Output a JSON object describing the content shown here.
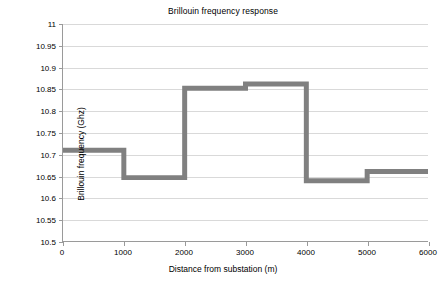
{
  "chart_data": {
    "type": "line",
    "title": "Brillouin frequency response",
    "xlabel": "Distance from substation (m)",
    "ylabel": "Brillouin frequency (Ghz)",
    "xlim": [
      0,
      6000
    ],
    "ylim": [
      10.5,
      11
    ],
    "grid": true,
    "legend": "none",
    "line_color": "#808080",
    "line_width": 5,
    "style": "step",
    "xticks": [
      0,
      1000,
      2000,
      3000,
      4000,
      5000,
      6000
    ],
    "xtick_labels": [
      "0",
      "1000",
      "2000",
      "3000",
      "4000",
      "5000",
      "6000"
    ],
    "yticks": [
      10.5,
      10.55,
      10.6,
      10.65,
      10.7,
      10.75,
      10.8,
      10.85,
      10.9,
      10.95,
      11
    ],
    "ytick_labels": [
      "10.5",
      "10.55",
      "10.6",
      "10.65",
      "10.7",
      "10.75",
      "10.8",
      "10.85",
      "10.9",
      "10.95",
      "11"
    ],
    "series": [
      {
        "name": "Brillouin frequency",
        "segments": [
          {
            "x_start": 0,
            "x_end": 1000,
            "y": 10.709
          },
          {
            "x_start": 1000,
            "x_end": 2000,
            "y": 10.646
          },
          {
            "x_start": 2000,
            "x_end": 3000,
            "y": 10.852
          },
          {
            "x_start": 3000,
            "x_end": 4000,
            "y": 10.862
          },
          {
            "x_start": 4000,
            "x_end": 5000,
            "y": 10.639
          },
          {
            "x_start": 5000,
            "x_end": 6000,
            "y": 10.66
          }
        ],
        "x": [
          0,
          1000,
          1000,
          2000,
          2000,
          3000,
          3000,
          4000,
          4000,
          5000,
          5000,
          6000
        ],
        "y": [
          10.709,
          10.709,
          10.646,
          10.646,
          10.852,
          10.852,
          10.862,
          10.862,
          10.639,
          10.639,
          10.66,
          10.66
        ]
      }
    ]
  }
}
